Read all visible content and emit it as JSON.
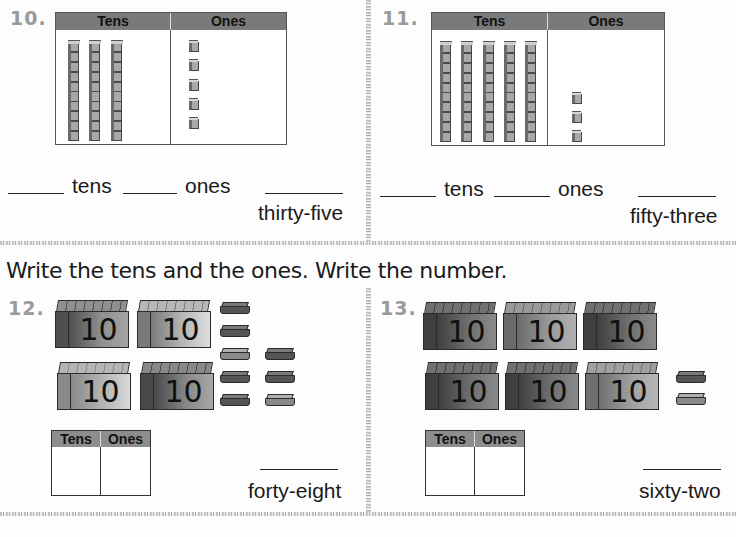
{
  "instruction": "Write the tens and the ones. Write the number.",
  "problems": {
    "p10": {
      "number": "10.",
      "table_headers": [
        "Tens",
        "Ones"
      ],
      "tens_rods": 3,
      "ones_cubes": 5,
      "tens_label": "tens",
      "ones_label": "ones",
      "number_word": "thirty-five"
    },
    "p11": {
      "number": "11.",
      "table_headers": [
        "Tens",
        "Ones"
      ],
      "tens_rods": 5,
      "ones_cubes": 3,
      "tens_label": "tens",
      "ones_label": "ones",
      "number_word": "fifty-three"
    },
    "p12": {
      "number": "12.",
      "ten_box_label": "10",
      "ten_boxes": 4,
      "ones_tiles": 8,
      "table_headers": [
        "Tens",
        "Ones"
      ],
      "number_word": "forty-eight"
    },
    "p13": {
      "number": "13.",
      "ten_box_label": "10",
      "ten_boxes": 6,
      "ones_tiles": 2,
      "table_headers": [
        "Tens",
        "Ones"
      ],
      "number_word": "sixty-two"
    }
  },
  "colors": {
    "table_header_bg": "#7a7a7a",
    "problem_number": "#9a9a9a",
    "divider": "#b5b5b5"
  }
}
